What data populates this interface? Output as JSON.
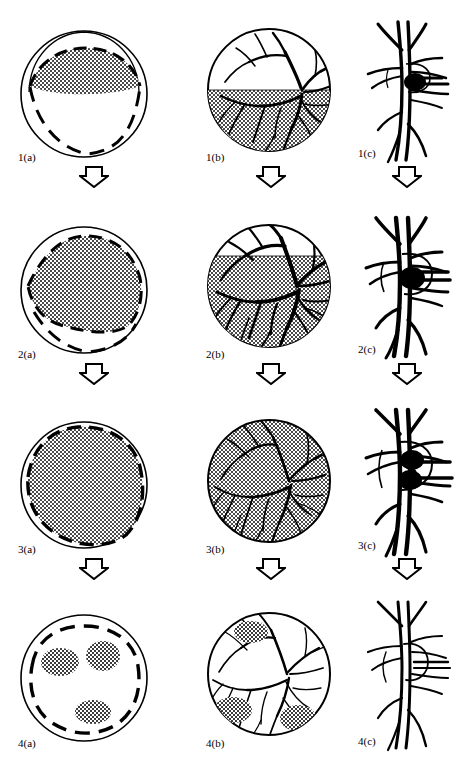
{
  "figure": {
    "type": "multi-panel-medical-illustration",
    "grid": {
      "rows": 4,
      "columns": 3
    },
    "column_kinds": [
      "schematic-globe-cross-section",
      "fundus-view-with-retinal-vessels",
      "vessel-close-up-detail"
    ],
    "flow_direction": "top-to-bottom",
    "arrow_icon": "hollow-down-arrow",
    "colors": {
      "ink": "#000000",
      "paper": "#ffffff",
      "stipple": "#555555"
    },
    "panels": [
      {
        "row": 1,
        "a": {
          "label": "1(a)",
          "shaded_extent": "narrow superior crescent band",
          "shaded_fraction": 0.12,
          "dashed_boundary": true
        },
        "b": {
          "label": "1(b)",
          "shaded_extent": "inferior half below horizontal fluid level",
          "shaded_fraction": 0.5,
          "vessels": "full dense arborisation",
          "patches": 0
        },
        "c": {
          "label": "1(c)",
          "lesion": "single small dark nodule on vessel",
          "lesion_count": 1,
          "vessel_calibre": "normal"
        }
      },
      {
        "row": 2,
        "a": {
          "label": "2(a)",
          "shaded_extent": "large superior two-thirds region",
          "shaded_fraction": 0.6,
          "dashed_boundary": true
        },
        "b": {
          "label": "2(b)",
          "shaded_extent": "most of disc below raised level",
          "shaded_fraction": 0.78,
          "vessels": "thickened dilated arborisation",
          "patches": 0
        },
        "c": {
          "label": "2(c)",
          "lesion": "enlarged dark nodule with sheathing",
          "lesion_count": 1,
          "vessel_calibre": "dilated"
        }
      },
      {
        "row": 3,
        "a": {
          "label": "3(a)",
          "shaded_extent": "near total involvement",
          "shaded_fraction": 0.88,
          "dashed_boundary": true
        },
        "b": {
          "label": "3(b)",
          "shaded_extent": "entire disc",
          "shaded_fraction": 1.0,
          "vessels": "attenuated narrowed arborisation",
          "patches": 0
        },
        "c": {
          "label": "3(c)",
          "lesion": "two confluent dark nodules",
          "lesion_count": 2,
          "vessel_calibre": "irregular sheathed"
        }
      },
      {
        "row": 4,
        "a": {
          "label": "4(a)",
          "shaded_extent": "three residual isolated patches",
          "shaded_fraction": 0.08,
          "dashed_boundary": true,
          "patches": 3
        },
        "b": {
          "label": "4(b)",
          "shaded_extent": "three residual scar patches",
          "shaded_fraction": 0.08,
          "vessels": "thin regressed arborisation",
          "patches": 3
        },
        "c": {
          "label": "4(c)",
          "lesion": "none - nodule resolved",
          "lesion_count": 0,
          "vessel_calibre": "thin regressed"
        }
      }
    ],
    "arrows": [
      {
        "after_row": 1,
        "columns": [
          "a",
          "b",
          "c"
        ]
      },
      {
        "after_row": 2,
        "columns": [
          "a",
          "b",
          "c"
        ]
      },
      {
        "after_row": 3,
        "columns": [
          "a",
          "b",
          "c"
        ]
      }
    ]
  }
}
